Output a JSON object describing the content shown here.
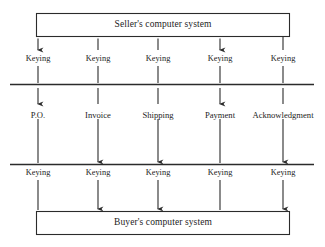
{
  "diagram": {
    "type": "flow-diagram",
    "colors": {
      "line": "#2b2b2b",
      "text": "#1d1d1d",
      "background": "#ffffff"
    },
    "nodes": {
      "top_system": {
        "label": "Seller's computer system",
        "shape": "rectangle"
      },
      "bottom_system": {
        "label": "Buyer's computer system",
        "shape": "rectangle"
      }
    },
    "boundaries": {
      "upper_divider": "horizontal-line",
      "lower_divider": "horizontal-line"
    },
    "keying_label": "Keying",
    "columns": [
      {
        "document": "P.O.",
        "keying_top": "Keying",
        "keying_bottom": "Keying",
        "direction": "up",
        "arrow_top": "up",
        "arrow_mid": "up",
        "arrow_bottom": "none"
      },
      {
        "document": "Invoice",
        "keying_top": "Keying",
        "keying_bottom": "Keying",
        "direction": "down",
        "arrow_top": "none",
        "arrow_mid": "down",
        "arrow_bottom": "down"
      },
      {
        "document": "Shipping",
        "keying_top": "Keying",
        "keying_bottom": "Keying",
        "direction": "down",
        "arrow_top": "none",
        "arrow_mid": "down",
        "arrow_bottom": "down"
      },
      {
        "document": "Payment",
        "keying_top": "Keying",
        "keying_bottom": "Keying",
        "direction": "up",
        "arrow_top": "up",
        "arrow_mid": "up",
        "arrow_bottom": "none"
      },
      {
        "document": "Acknowledgment",
        "keying_top": "Keying",
        "keying_bottom": "Keying",
        "direction": "down",
        "arrow_top": "none",
        "arrow_mid": "down",
        "arrow_bottom": "down"
      }
    ]
  }
}
